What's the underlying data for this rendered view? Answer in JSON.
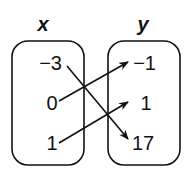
{
  "diagram": {
    "type": "mapping",
    "domain_label": "x",
    "range_label": "y",
    "domain": [
      "−3",
      "0",
      "1"
    ],
    "range": [
      "−1",
      "1",
      "17"
    ],
    "mappings": [
      {
        "from": "−3",
        "to": "17"
      },
      {
        "from": "0",
        "to": "−1"
      },
      {
        "from": "1",
        "to": "1"
      }
    ]
  }
}
